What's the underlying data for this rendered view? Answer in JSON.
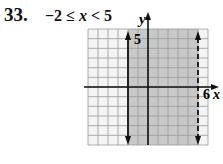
{
  "problem": {
    "number": "33.",
    "inequality_prefix": "−2 ≤ ",
    "var": "x",
    "inequality_suffix": " < 5"
  },
  "chart_data": {
    "type": "region",
    "title": "−2 ≤ x < 5",
    "xlabel": "x",
    "ylabel": "y",
    "xlim": [
      -6,
      6
    ],
    "ylim": [
      -6,
      6
    ],
    "grid": true,
    "tick_labels": {
      "y_top": "5",
      "x_right": "6"
    },
    "boundaries": [
      {
        "x": -2,
        "style": "solid",
        "included": true
      },
      {
        "x": 5,
        "style": "dashed",
        "included": false
      }
    ],
    "shaded_region": {
      "x_from": -2,
      "x_to": 5
    },
    "colors": {
      "shade": "#c8c8c8",
      "grid": "#9a9a9a",
      "axis": "#111111"
    }
  },
  "labels": {
    "y_axis": "y",
    "x_axis": "x",
    "y_tick": "5",
    "x_tick": "6"
  }
}
